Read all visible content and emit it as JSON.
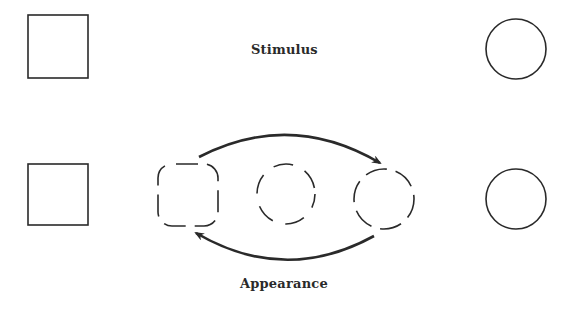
{
  "diagram": {
    "labels": {
      "stimulus": "Stimulus",
      "appearance": "Appearance"
    },
    "rows": {
      "stimulus": {
        "left_shape": "square",
        "right_shape": "circle"
      },
      "appearance": {
        "left_shape": "square",
        "intermediates": [
          "dashed-rounded-square",
          "dashed-squircle",
          "dashed-circle"
        ],
        "right_shape": "circle"
      }
    },
    "arrows": [
      {
        "from": "dashed-rounded-square",
        "to": "dashed-circle",
        "position": "top"
      },
      {
        "from": "dashed-circle",
        "to": "dashed-rounded-square",
        "position": "bottom"
      }
    ],
    "colors": {
      "stroke": "#2a2a2a",
      "background": "#ffffff"
    }
  }
}
